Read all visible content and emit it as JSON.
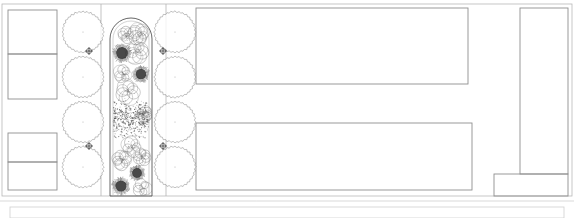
{
  "drawing": {
    "title": "Landscape Site Plan",
    "type": "architectural-plan",
    "canvas": {
      "width": 574,
      "height": 218
    },
    "colors": {
      "background": "#ffffff",
      "line_primary": "#8f8f8f",
      "line_secondary": "#b4b4b4",
      "line_hairline": "#cfcfcf",
      "vegetation_outline": "#6e6e6e",
      "shrub_dark": "#303030",
      "groundcover_speckle": "#4a4a4a",
      "bed_outline": "#555555"
    }
  },
  "site_outline": {
    "name": "site-boundary",
    "x": 2,
    "y": 4,
    "width": 570,
    "height": 192
  },
  "buildings": [
    {
      "name": "west-building-upper-bay",
      "x": 8,
      "y": 10,
      "width": 49,
      "height": 44
    },
    {
      "name": "west-building-lower-bay",
      "x": 8,
      "y": 54,
      "width": 49,
      "height": 45
    },
    {
      "name": "west-building-mid-bay",
      "x": 8,
      "y": 133,
      "width": 49,
      "height": 29
    },
    {
      "name": "west-building-south-bay",
      "x": 8,
      "y": 162,
      "width": 49,
      "height": 28
    },
    {
      "name": "north-courtyard-block",
      "x": 196,
      "y": 8,
      "width": 272,
      "height": 76
    },
    {
      "name": "south-courtyard-block",
      "x": 196,
      "y": 123,
      "width": 276,
      "height": 67
    },
    {
      "name": "east-tower-block",
      "x": 520,
      "y": 8,
      "width": 48,
      "height": 166
    },
    {
      "name": "southeast-annex",
      "x": 494,
      "y": 174,
      "width": 74,
      "height": 22
    }
  ],
  "walkway": {
    "name": "central-walkway",
    "left_edge_x": 101,
    "right_edge_x": 166,
    "top_y": 4,
    "bottom_y": 196
  },
  "planting_bed": {
    "name": "central-planting-bed",
    "x": 110,
    "y": 18,
    "width": 42,
    "height": 178,
    "arch_radius": 21,
    "inner_offset": 3,
    "description": "arched-top raised planting bed with mixed perennials and groundcover"
  },
  "tree_rows": {
    "west_row": {
      "name": "tree-row-west",
      "center_x": 83,
      "radius": 21,
      "centers_y": [
        32,
        77,
        122,
        167
      ]
    },
    "east_row": {
      "name": "tree-row-east",
      "center_x": 175,
      "radius": 21,
      "centers_y": [
        32,
        77,
        122,
        167
      ]
    }
  },
  "markers": [
    {
      "name": "survey-marker-west-upper",
      "x": 89,
      "y": 51
    },
    {
      "name": "survey-marker-east-upper",
      "x": 163,
      "y": 51
    },
    {
      "name": "survey-marker-west-lower",
      "x": 89,
      "y": 146
    },
    {
      "name": "survey-marker-east-lower",
      "x": 163,
      "y": 146
    }
  ],
  "shrubs": [
    {
      "name": "specimen-shrub-1",
      "cx": 122,
      "cy": 53,
      "r": 9.5
    },
    {
      "name": "specimen-shrub-2",
      "cx": 141,
      "cy": 74,
      "r": 8.5
    },
    {
      "name": "specimen-shrub-3",
      "cx": 137,
      "cy": 173,
      "r": 8.0
    },
    {
      "name": "specimen-shrub-4",
      "cx": 121,
      "cy": 186,
      "r": 9.0
    }
  ],
  "perennial_clusters": [
    {
      "name": "perennial-cluster-1",
      "cx": 139,
      "cy": 34,
      "r": 9
    },
    {
      "name": "perennial-cluster-2",
      "cx": 137,
      "cy": 52,
      "r": 10
    },
    {
      "name": "perennial-cluster-3",
      "cx": 123,
      "cy": 74,
      "r": 8
    },
    {
      "name": "perennial-cluster-4",
      "cx": 128,
      "cy": 92,
      "r": 11
    },
    {
      "name": "perennial-cluster-5",
      "cx": 132,
      "cy": 147,
      "r": 9
    },
    {
      "name": "perennial-cluster-6",
      "cx": 122,
      "cy": 160,
      "r": 9
    },
    {
      "name": "perennial-cluster-7",
      "cx": 142,
      "cy": 157,
      "r": 8
    },
    {
      "name": "perennial-cluster-8",
      "cx": 142,
      "cy": 188,
      "r": 8
    },
    {
      "name": "perennial-cluster-9",
      "cx": 126,
      "cy": 35,
      "r": 7
    },
    {
      "name": "perennial-cluster-10",
      "cx": 144,
      "cy": 114,
      "r": 7
    }
  ],
  "groundcover_fields": [
    {
      "name": "groundcover-field-upper",
      "x": 113,
      "y": 100,
      "width": 36,
      "height": 26
    },
    {
      "name": "groundcover-field-lower",
      "x": 113,
      "y": 108,
      "width": 36,
      "height": 30
    }
  ],
  "footer": {
    "name": "drawing-footer-panel",
    "divider_y": 201,
    "panel": {
      "x": 10,
      "y": 207,
      "width": 554,
      "height": 11
    }
  }
}
